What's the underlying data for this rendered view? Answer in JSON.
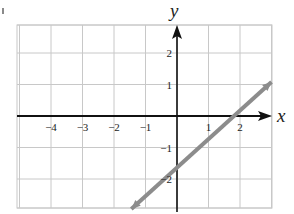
{
  "chart_data": {
    "type": "line",
    "title": "",
    "xlabel": "x",
    "ylabel": "y",
    "xlim": [
      -5,
      3
    ],
    "ylim": [
      -3,
      3
    ],
    "grid": true,
    "x_ticks": [
      "-4",
      "-3",
      "-2",
      "-1",
      "1",
      "2"
    ],
    "y_ticks": [
      "2",
      "1",
      "-1",
      "-2"
    ],
    "series": [
      {
        "name": "line",
        "color": "#8c8c8c",
        "arrows_both_ends": true,
        "points": [
          {
            "x": -1.45,
            "y": -2.95
          },
          {
            "x": 1.78,
            "y": 0
          },
          {
            "x": 3.0,
            "y": 1.08
          }
        ],
        "approx_equation": "y ≈ 0.9x - 1.6",
        "x_intercept": 1.78,
        "y_intercept": -1.6
      }
    ]
  },
  "colors": {
    "grid": "#c8c8c8",
    "axes": "#111111",
    "line": "#8c8c8c"
  }
}
